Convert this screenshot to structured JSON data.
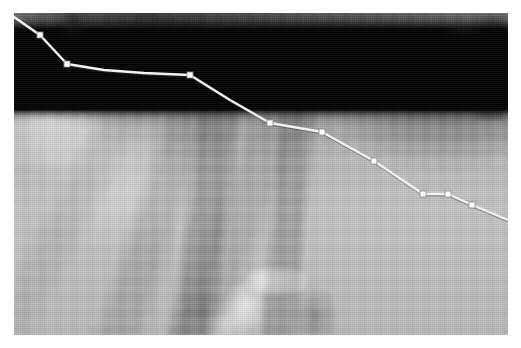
{
  "viewer": {
    "name": "image-annotation-viewer",
    "canvas_width": 521,
    "canvas_height": 348,
    "background_color": "#ffffff"
  },
  "image_plate": {
    "name": "grayscale-terrain-photo",
    "left": 14,
    "top": 13,
    "width": 494,
    "height": 322,
    "color_mode": "grayscale",
    "base_tone": "#8d8d8d",
    "description_regions": [
      {
        "name": "dark-massif-top",
        "tone": "#3a3a3a"
      },
      {
        "name": "light-snowfield-left",
        "tone": "#d8d8d8"
      },
      {
        "name": "bright-specular-patch",
        "tone": "#ffffff"
      },
      {
        "name": "dark-vertical-band-right",
        "tone": "#101010"
      },
      {
        "name": "mid-slope-field",
        "tone": "#bcbcbc"
      }
    ]
  },
  "annotation": {
    "name": "traced-boundary-polyline",
    "stroke_color": "#f2f2f2",
    "stroke_shadow_color": "#3c3c3c",
    "stroke_width": 2.4,
    "vertex_fill": "#fdfdfd",
    "vertex_stroke": "#888888",
    "vertex_size": 6,
    "coordinate_space": "image-plate-local",
    "points": [
      {
        "x": 0,
        "y": 4
      },
      {
        "x": 26,
        "y": 22
      },
      {
        "x": 53,
        "y": 51
      },
      {
        "x": 90,
        "y": 57
      },
      {
        "x": 130,
        "y": 60
      },
      {
        "x": 176,
        "y": 62
      },
      {
        "x": 216,
        "y": 87
      },
      {
        "x": 256,
        "y": 110
      },
      {
        "x": 308,
        "y": 119
      },
      {
        "x": 360,
        "y": 148
      },
      {
        "x": 409,
        "y": 181
      },
      {
        "x": 434,
        "y": 181
      },
      {
        "x": 458,
        "y": 192
      },
      {
        "x": 494,
        "y": 207
      }
    ],
    "vertex_indices": [
      1,
      2,
      5,
      7,
      8,
      9,
      10,
      11,
      12
    ],
    "point_count": 14,
    "vertex_count": 9
  }
}
